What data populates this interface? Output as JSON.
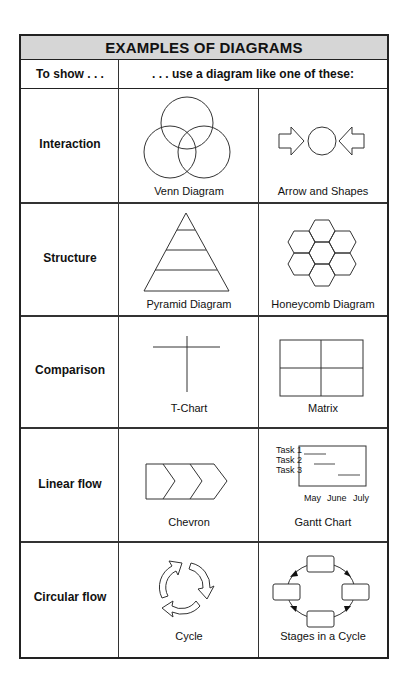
{
  "title": "EXAMPLES OF DIAGRAMS",
  "columns": {
    "left": "To show . . .",
    "right": ". . . use a diagram like one of these:"
  },
  "rows": [
    {
      "label": "Interaction",
      "diagrams": [
        "Venn Diagram",
        "Arrow and Shapes"
      ]
    },
    {
      "label": "Structure",
      "diagrams": [
        "Pyramid Diagram",
        "Honeycomb Diagram"
      ]
    },
    {
      "label": "Comparison",
      "diagrams": [
        "T-Chart",
        "Matrix"
      ]
    },
    {
      "label": "Linear flow",
      "diagrams": [
        "Chevron",
        "Gantt Chart"
      ]
    },
    {
      "label": "Circular flow",
      "diagrams": [
        "Cycle",
        "Stages in a Cycle"
      ]
    }
  ],
  "gantt": {
    "tasks": [
      "Task 1",
      "Task 2",
      "Task 3"
    ],
    "months": [
      "May",
      "June",
      "July"
    ]
  },
  "colors": {
    "header_bg": "#d6d6d6",
    "border": "#222222",
    "gantt_bar": "#888888"
  }
}
